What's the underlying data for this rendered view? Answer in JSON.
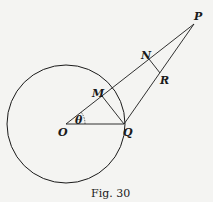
{
  "figure": {
    "caption": "Fig. 30",
    "points": {
      "O": {
        "label": "O",
        "x": 66,
        "y": 124
      },
      "Q": {
        "label": "Q",
        "x": 124,
        "y": 124
      },
      "P": {
        "label": "P",
        "x": 194,
        "y": 24
      },
      "M": {
        "label": "M",
        "x": 102,
        "y": 96
      },
      "N": {
        "label": "N",
        "x": 149,
        "y": 59
      },
      "R": {
        "label": "R",
        "x": 158,
        "y": 75
      }
    },
    "angle_label": "θ",
    "circle": {
      "cx": 66,
      "cy": 124,
      "r": 59
    },
    "stroke_color": "#1a1a1a",
    "background_color": "#f4f4f2"
  }
}
